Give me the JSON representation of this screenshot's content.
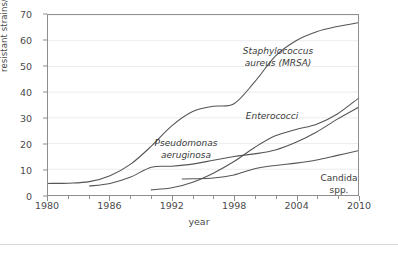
{
  "chart_data": {
    "type": "line",
    "title": "",
    "xlabel": "year",
    "ylabel": "resistant strains/%",
    "xlim": [
      1980,
      2010
    ],
    "ylim": [
      0,
      70
    ],
    "xticks": [
      1980,
      1986,
      1992,
      1998,
      2004,
      2010
    ],
    "xtick_labels": [
      "1980",
      "1986",
      "1992",
      "1998",
      "2004",
      "2010"
    ],
    "xtick_minor_step": 2,
    "yticks": [
      0,
      10,
      20,
      30,
      40,
      50,
      60,
      70
    ],
    "ytick_labels": [
      "0",
      "10",
      "20",
      "30",
      "40",
      "50",
      "60",
      "70"
    ],
    "grid": "horizontal",
    "legend": "inline-labels",
    "line_color": "#555555",
    "grid_color": "#ececec",
    "axis_color": "#8e8e8e",
    "series": [
      {
        "name": "Staphylococcus aureus (MRSA)",
        "label_line1": "Staphylococcus",
        "label_line2": "aureus (MRSA)",
        "label_style": "italic-genus-species",
        "x": [
          1980,
          1982,
          1984,
          1986,
          1988,
          1990,
          1992,
          1994,
          1996,
          1998,
          2000,
          2002,
          2004,
          2006,
          2008,
          2010
        ],
        "y": [
          4.5,
          4.6,
          5.2,
          7.5,
          12.0,
          19.0,
          27.0,
          32.5,
          34.5,
          35.5,
          44.0,
          54.0,
          60.0,
          63.5,
          65.5,
          67.0
        ]
      },
      {
        "name": "Pseudomonas aeruginosa",
        "label_line1": "Pseudomonas",
        "label_line2": "aeruginosa",
        "label_style": "italic",
        "x": [
          1984,
          1986,
          1988,
          1990,
          1992,
          1994,
          1996,
          1998,
          2000,
          2002,
          2004,
          2006,
          2008,
          2010
        ],
        "y": [
          3.5,
          4.5,
          7.0,
          10.8,
          11.2,
          12.0,
          13.5,
          15.0,
          16.0,
          17.5,
          20.5,
          24.5,
          29.5,
          34.0
        ]
      },
      {
        "name": "Enterococci",
        "label_line1": "Enterococci",
        "label_line2": "",
        "label_style": "italic",
        "x": [
          1990,
          1992,
          1994,
          1996,
          1998,
          2000,
          2002,
          2004,
          2006,
          2008,
          2010
        ],
        "y": [
          2.0,
          2.8,
          5.0,
          8.5,
          13.0,
          18.5,
          23.0,
          25.5,
          27.5,
          31.5,
          37.5
        ]
      },
      {
        "name": "Candida spp.",
        "label_line1": "Candida",
        "label_line2": "spp.",
        "label_style": "italic-genus-roman-spp",
        "x": [
          1993,
          1994,
          1996,
          1998,
          2000,
          2002,
          2004,
          2006,
          2008,
          2010
        ],
        "y": [
          6.2,
          6.3,
          6.6,
          7.8,
          10.2,
          11.5,
          12.4,
          13.6,
          15.4,
          17.2
        ]
      }
    ]
  },
  "axes": {
    "y_label": "resistant strains/%",
    "x_label": "year"
  },
  "labels": {
    "mrsa_line1": "Staphylococcus",
    "mrsa_line2": "aureus (MRSA)",
    "pseudomonas_line1": "Pseudomonas",
    "pseudomonas_line2": "aeruginosa",
    "enterococci": "Enterococci",
    "candida_line1": "Candida",
    "candida_line2": "spp."
  },
  "ytick_labels": [
    "0",
    "10",
    "20",
    "30",
    "40",
    "50",
    "60",
    "70"
  ],
  "xtick_labels": [
    "1980",
    "1986",
    "1992",
    "1998",
    "2004",
    "2010"
  ]
}
